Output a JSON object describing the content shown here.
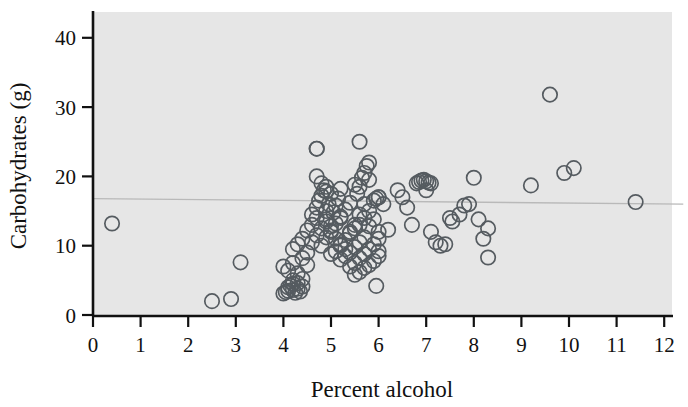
{
  "chart_data": {
    "type": "scatter",
    "title": "",
    "xlabel": "Percent alcohol",
    "ylabel": "Carbohydrates (g)",
    "xlim": [
      0,
      12.4
    ],
    "ylim": [
      0,
      43
    ],
    "xticks": [
      0,
      1,
      2,
      3,
      4,
      5,
      6,
      7,
      8,
      9,
      10,
      11,
      12
    ],
    "xtick_labels": [
      "0",
      "1",
      "2",
      "3",
      "4",
      "5",
      "6",
      "7",
      "8",
      "9",
      "10",
      "11",
      "12"
    ],
    "yticks": [
      0,
      10,
      20,
      30,
      40
    ],
    "ytick_labels": [
      "0",
      "10",
      "20",
      "30",
      "40"
    ],
    "grid": false,
    "legend": null,
    "marker_style": "open-circle",
    "marker_color": "#555b60",
    "panel_color": "#e6e6e6",
    "trendline": {
      "type": "linear-fit",
      "color": "#b9b9b9",
      "x_start": 0,
      "y_start": 16.8,
      "x_end": 12.4,
      "y_end": 16.0
    },
    "x": [
      0.4,
      2.5,
      2.9,
      3.1,
      4.0,
      4.05,
      4.1,
      4.1,
      4.15,
      4.2,
      4.2,
      4.2,
      4.25,
      4.3,
      4.3,
      4.35,
      4.4,
      4.4,
      4.0,
      4.1,
      4.2,
      4.3,
      4.4,
      4.5,
      4.2,
      4.3,
      4.4,
      4.5,
      4.5,
      4.6,
      4.6,
      4.7,
      4.7,
      4.8,
      4.8,
      4.9,
      4.9,
      5.0,
      4.6,
      4.7,
      4.75,
      4.8,
      4.85,
      4.9,
      4.95,
      5.0,
      5.05,
      5.1,
      5.15,
      5.2,
      4.7,
      4.8,
      4.9,
      5.0,
      5.1,
      5.2,
      5.3,
      5.4,
      4.7,
      4.9,
      5.0,
      5.1,
      5.2,
      5.3,
      5.4,
      5.5,
      5.0,
      5.1,
      5.2,
      5.3,
      5.4,
      5.5,
      5.6,
      5.7,
      5.2,
      5.3,
      5.4,
      5.5,
      5.6,
      5.7,
      5.8,
      5.9,
      5.4,
      5.5,
      5.6,
      5.7,
      5.8,
      5.9,
      6.0,
      6.0,
      5.5,
      5.6,
      5.7,
      5.8,
      5.9,
      6.0,
      6.0,
      5.95,
      5.6,
      5.7,
      5.8,
      5.9,
      6.0,
      5.55,
      5.6,
      5.65,
      5.7,
      5.75,
      4.7,
      5.6,
      5.8,
      4.9,
      5.2,
      5.5,
      5.8,
      5.95,
      6.0,
      6.1,
      6.2,
      6.4,
      6.5,
      6.8,
      6.85,
      6.9,
      6.95,
      7.0,
      7.05,
      7.1,
      7.0,
      6.6,
      6.7,
      7.1,
      7.2,
      7.3,
      7.4,
      7.5,
      7.55,
      7.7,
      7.8,
      7.9,
      8.0,
      8.1,
      8.2,
      8.3,
      8.3,
      9.2,
      9.6,
      9.9,
      10.1,
      11.4
    ],
    "y": [
      13.2,
      2.0,
      2.3,
      7.6,
      3.1,
      3.3,
      3.5,
      4.0,
      4.2,
      3.6,
      4.5,
      5.0,
      3.2,
      3.8,
      4.6,
      3.4,
      4.1,
      5.2,
      7.0,
      6.4,
      7.5,
      6.0,
      8.2,
      7.2,
      9.5,
      10.2,
      11.0,
      9.0,
      12.2,
      10.5,
      13.0,
      11.5,
      14.0,
      10.0,
      12.5,
      11.2,
      13.5,
      12.0,
      14.5,
      15.5,
      16.5,
      17.2,
      18.0,
      15.0,
      16.0,
      17.5,
      14.8,
      15.8,
      16.8,
      14.2,
      20.0,
      19.0,
      18.5,
      12.8,
      13.2,
      14.0,
      15.2,
      16.2,
      24.0,
      13.8,
      12.2,
      11.0,
      10.2,
      9.5,
      12.0,
      13.0,
      8.8,
      9.2,
      10.0,
      10.8,
      11.8,
      12.5,
      14.5,
      16.0,
      8.0,
      8.5,
      9.0,
      9.8,
      10.5,
      11.2,
      12.8,
      13.8,
      7.0,
      7.5,
      8.2,
      8.8,
      9.5,
      10.2,
      11.0,
      12.0,
      5.8,
      6.2,
      6.8,
      7.2,
      7.8,
      8.5,
      9.2,
      4.2,
      13.0,
      14.0,
      15.0,
      16.5,
      17.0,
      17.5,
      18.5,
      19.8,
      20.5,
      21.5,
      24.0,
      25.0,
      22.0,
      17.8,
      18.2,
      18.8,
      19.5,
      16.8,
      17.0,
      16.0,
      12.3,
      18.0,
      17.0,
      19.0,
      19.2,
      19.4,
      19.5,
      19.3,
      19.1,
      19.0,
      18.0,
      15.5,
      13.0,
      12.0,
      10.5,
      10.0,
      10.2,
      14.0,
      13.5,
      14.5,
      15.8,
      16.0,
      19.8,
      13.8,
      11.0,
      8.3,
      12.5,
      18.7,
      31.8,
      20.5,
      21.2,
      16.3
    ]
  }
}
